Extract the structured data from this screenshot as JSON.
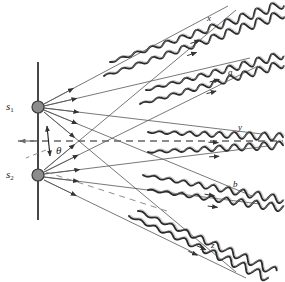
{
  "figure": {
    "background_color": "#ffffff",
    "ink_color": "#1a1a1a",
    "ray_color": "#555555",
    "dash_color": "#666666",
    "source_fill": "#8c8c8c",
    "source_stroke": "#3a3a3a",
    "width": 285,
    "height": 282
  },
  "sources": [
    {
      "id": "s1",
      "label": "s",
      "sub": "1",
      "x": 38,
      "y": 107,
      "r": 6,
      "label_x": 6,
      "label_y": 101
    },
    {
      "id": "s2",
      "label": "s",
      "sub": "2",
      "x": 38,
      "y": 175,
      "r": 6,
      "label_x": 6,
      "label_y": 169
    }
  ],
  "barrier": {
    "x": 38,
    "y_top": 62,
    "y_bottom": 220
  },
  "axis": {
    "label": "central-axis",
    "y": 141,
    "x_start": 18,
    "x_end": 283,
    "dash": "7,5"
  },
  "angle": {
    "symbol": "θ",
    "label_x": 56,
    "label_y": 145,
    "vertex_x": 48,
    "vertex_y": 148
  },
  "ray_labels": [
    {
      "id": "x",
      "text": "x",
      "x": 207,
      "y": 14
    },
    {
      "id": "a",
      "text": "a",
      "x": 228,
      "y": 68
    },
    {
      "id": "y",
      "text": "y",
      "x": 238,
      "y": 123
    },
    {
      "id": "b",
      "text": "b",
      "x": 233,
      "y": 180
    },
    {
      "id": "z",
      "text": "z",
      "x": 211,
      "y": 241
    }
  ],
  "wave_trains": [
    {
      "id": "x-upper",
      "label": "x",
      "start_x": 110,
      "start_y": 62,
      "end_x": 283,
      "end_y": 4,
      "amplitude": 4.2,
      "wavelength": 16,
      "phase": 0
    },
    {
      "id": "x-lower",
      "label": "x",
      "start_x": 104,
      "start_y": 76,
      "end_x": 283,
      "end_y": 14,
      "amplitude": 4.2,
      "wavelength": 16,
      "phase": 0.5
    },
    {
      "id": "a-upper",
      "label": "a",
      "start_x": 146,
      "start_y": 90,
      "end_x": 283,
      "end_y": 55,
      "amplitude": 3.8,
      "wavelength": 15,
      "phase": 0
    },
    {
      "id": "a-lower",
      "label": "a",
      "start_x": 140,
      "start_y": 104,
      "end_x": 283,
      "end_y": 64,
      "amplitude": 3.8,
      "wavelength": 15,
      "phase": 0.5
    },
    {
      "id": "y-upper",
      "label": "y",
      "start_x": 148,
      "start_y": 132,
      "end_x": 283,
      "end_y": 137,
      "amplitude": 3.8,
      "wavelength": 15,
      "phase": 0
    },
    {
      "id": "y-lower",
      "label": "y",
      "start_x": 148,
      "start_y": 152,
      "end_x": 283,
      "end_y": 145,
      "amplitude": 3.8,
      "wavelength": 15,
      "phase": 0
    },
    {
      "id": "b-upper",
      "label": "b",
      "start_x": 143,
      "start_y": 175,
      "end_x": 283,
      "end_y": 200,
      "amplitude": 3.8,
      "wavelength": 15,
      "phase": 0
    },
    {
      "id": "b-lower",
      "label": "b",
      "start_x": 148,
      "start_y": 190,
      "end_x": 283,
      "end_y": 208,
      "amplitude": 3.8,
      "wavelength": 15,
      "phase": 0.5
    },
    {
      "id": "z-upper",
      "label": "z",
      "start_x": 129,
      "start_y": 216,
      "end_x": 268,
      "end_y": 278,
      "amplitude": 4.2,
      "wavelength": 16,
      "phase": 0
    },
    {
      "id": "z-lower",
      "label": "z",
      "start_x": 138,
      "start_y": 211,
      "end_x": 276,
      "end_y": 272,
      "amplitude": 4.2,
      "wavelength": 16,
      "phase": 0.5
    }
  ],
  "rays": [
    {
      "id": "s1-to-x",
      "from": "s1",
      "x1": 44,
      "y1": 104,
      "x2": 228,
      "y2": 6
    },
    {
      "id": "s1-to-a",
      "from": "s1",
      "x1": 44,
      "y1": 106,
      "x2": 250,
      "y2": 58
    },
    {
      "id": "s1-to-y",
      "from": "s1",
      "x1": 44,
      "y1": 108,
      "x2": 262,
      "y2": 134
    },
    {
      "id": "s1-to-b",
      "from": "s1",
      "x1": 44,
      "y1": 110,
      "x2": 252,
      "y2": 196
    },
    {
      "id": "s1-to-z",
      "from": "s1",
      "x1": 44,
      "y1": 112,
      "x2": 236,
      "y2": 272
    },
    {
      "id": "s2-to-x",
      "from": "s2",
      "x1": 44,
      "y1": 170,
      "x2": 236,
      "y2": 10
    },
    {
      "id": "s2-to-a",
      "from": "s2",
      "x1": 44,
      "y1": 172,
      "x2": 258,
      "y2": 66
    },
    {
      "id": "s2-to-y",
      "from": "s2",
      "x1": 44,
      "y1": 174,
      "x2": 268,
      "y2": 146
    },
    {
      "id": "s2-to-b",
      "from": "s2",
      "x1": 44,
      "y1": 177,
      "x2": 260,
      "y2": 204
    },
    {
      "id": "s2-to-z",
      "from": "s2",
      "x1": 44,
      "y1": 180,
      "x2": 246,
      "y2": 278
    }
  ],
  "direction_arrows_count": 14
}
